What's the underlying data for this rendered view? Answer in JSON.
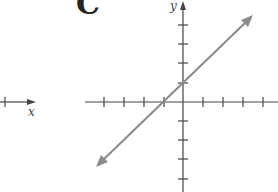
{
  "figure": {
    "panel_label": "C",
    "x_axis_label": "x",
    "y_axis_label": "y",
    "left_partial_axis_label": "x"
  },
  "colors": {
    "axis": "#444444",
    "line": "#8a8a8a",
    "background": "#ffffff"
  },
  "graph": {
    "equation": "y = x + 1",
    "slope": 1,
    "y_intercept": 1,
    "x_intercept": -1,
    "x_ticks": [
      -4,
      -3,
      -2,
      -1,
      1,
      2,
      3,
      4
    ],
    "y_ticks": [
      4,
      3,
      2,
      1,
      -1,
      -2,
      -3,
      -4
    ],
    "arrows": [
      "both-ends"
    ]
  }
}
